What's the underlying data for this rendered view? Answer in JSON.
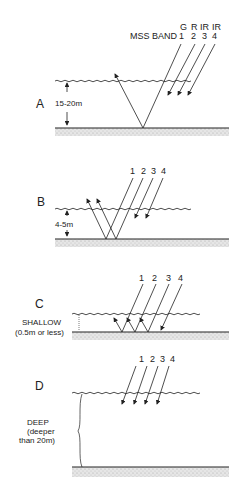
{
  "header": {
    "band_title": "MSS BAND",
    "band_colors": [
      "G",
      "R",
      "IR",
      "IR"
    ],
    "band_numbers": [
      "1",
      "2",
      "3",
      "4"
    ]
  },
  "panels": [
    {
      "id": "A",
      "label": "A",
      "depth": "15-20m"
    },
    {
      "id": "B",
      "label": "B",
      "depth": "4-5m",
      "band_numbers": [
        "1",
        "2",
        "3",
        "4"
      ]
    },
    {
      "id": "C",
      "label": "C",
      "depth_line1": "SHALLOW",
      "depth_line2": "(0.5m or less)",
      "band_numbers": [
        "1",
        "2",
        "3",
        "4"
      ]
    },
    {
      "id": "D",
      "label": "D",
      "depth_line1": "DEEP",
      "depth_line2": "(deeper",
      "depth_line3": "than 20m)",
      "band_numbers": [
        "1",
        "2",
        "3",
        "4"
      ]
    }
  ],
  "colors": {
    "line": "#222222",
    "sediment": "#d8d8d8"
  }
}
